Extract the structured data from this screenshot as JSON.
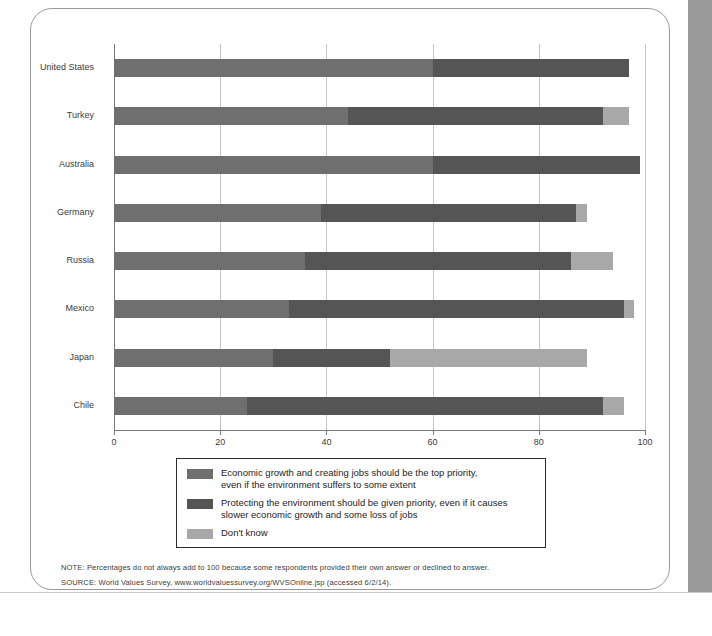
{
  "colors": {
    "economic": "#6f6f6f",
    "environment": "#555555",
    "dontknow": "#a8a8a8",
    "grid": "#c6c6c6",
    "axis": "#7a7a7a",
    "text": "#3b3b3b"
  },
  "chart_data": {
    "type": "bar",
    "orientation": "horizontal",
    "stacked": true,
    "title": "",
    "xlabel": "",
    "ylabel": "",
    "xlim": [
      0,
      100
    ],
    "xticks": [
      0,
      20,
      40,
      60,
      80,
      100
    ],
    "xtick_labels": [
      "0",
      "20",
      "40",
      "60",
      "80",
      "100"
    ],
    "grid": true,
    "legend_position": "below-plot",
    "categories": [
      "United States",
      "Turkey",
      "Australia",
      "Germany",
      "Russia",
      "Mexico",
      "Japan",
      "Chile"
    ],
    "series": [
      {
        "name": "Economic growth and creating jobs should be the top priority, even if the environment suffers to some extent",
        "short_name": "Economic growth",
        "color": "#6f6f6f",
        "values": [
          60,
          44,
          60,
          39,
          36,
          33,
          30,
          25
        ]
      },
      {
        "name": "Protecting the environment should be given priority, even if it causes slower economic growth and some loss of jobs",
        "short_name": "Protecting the environment",
        "color": "#555555",
        "values": [
          37,
          48,
          39,
          48,
          50,
          63,
          22,
          67
        ]
      },
      {
        "name": "Don't know",
        "short_name": "Don't know",
        "color": "#a8a8a8",
        "values": [
          0,
          5,
          0,
          2,
          8,
          2,
          37,
          4
        ]
      }
    ],
    "totals": [
      97,
      97,
      99,
      89,
      94,
      98,
      89,
      96
    ]
  },
  "legend": {
    "items": [
      {
        "swatch": "#6f6f6f",
        "line1": "Economic growth and creating jobs should be the top priority,",
        "line2": "even if the environment suffers to some extent"
      },
      {
        "swatch": "#555555",
        "line1": "Protecting the environment should be given priority, even if it causes",
        "line2": "slower economic growth and some loss of jobs"
      },
      {
        "swatch": "#a8a8a8",
        "line1": "Don't know",
        "line2": ""
      }
    ]
  },
  "footnotes": {
    "note": "NOTE: Percentages do not always add to 100 because some respondents provided their own answer or declined to answer.",
    "source": "SOURCE: World Values Survey, www.worldvaluessurvey.org/WVSOnline.jsp (accessed 6/2/14)."
  }
}
